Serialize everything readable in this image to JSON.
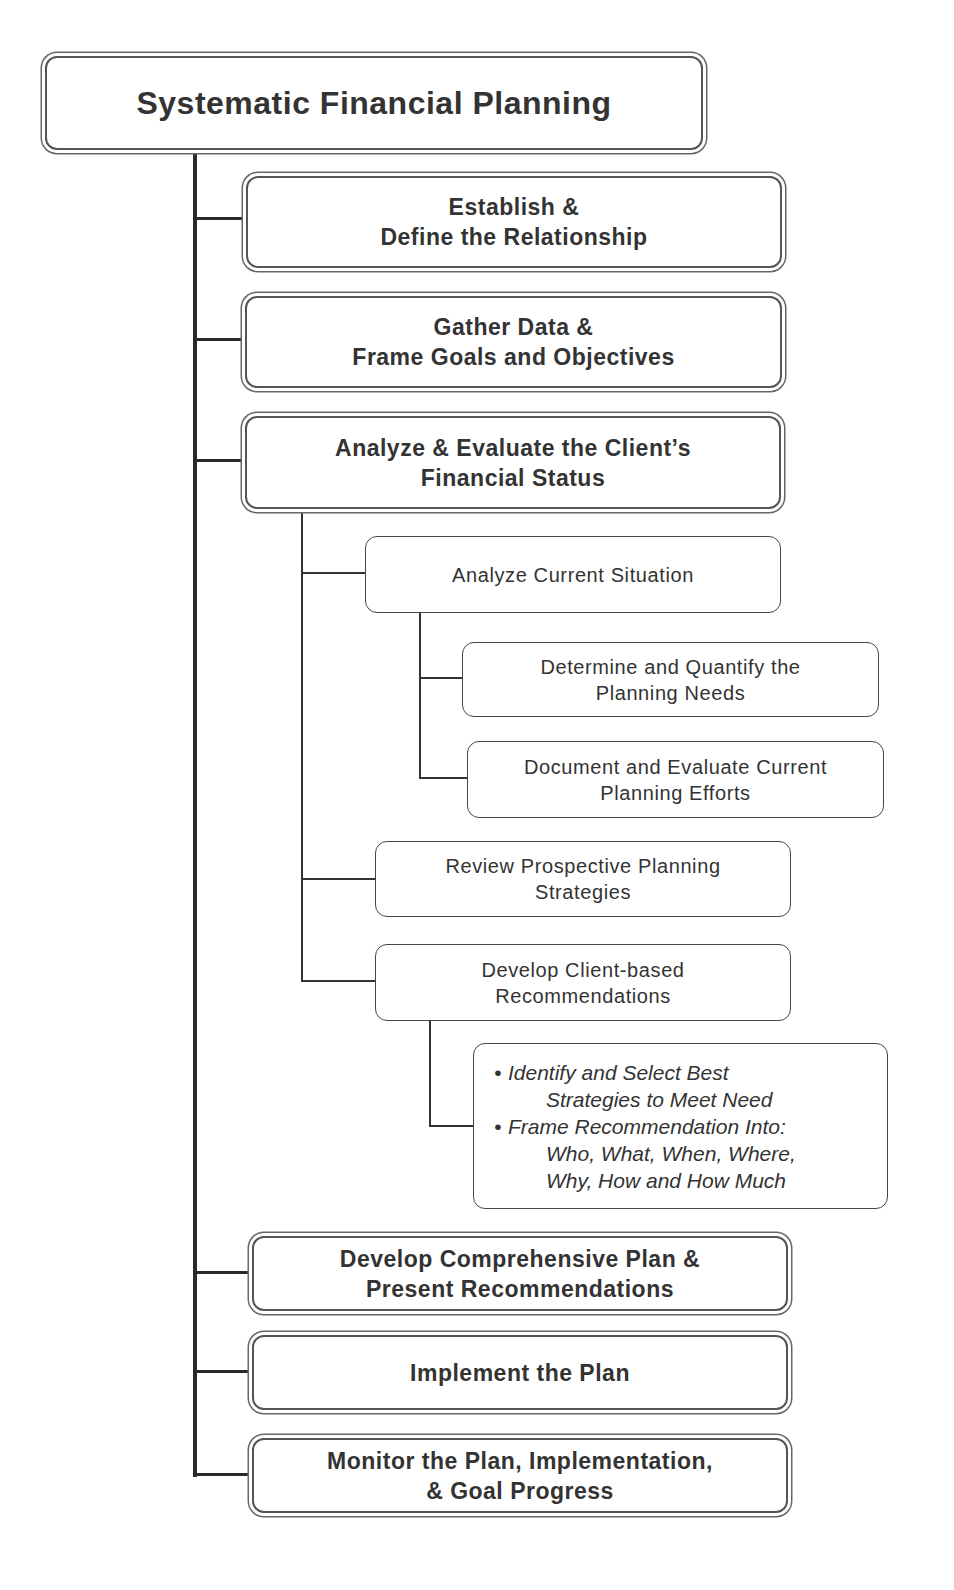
{
  "diagram": {
    "title": "Systematic Financial Planning",
    "steps": [
      {
        "line1": "Establish &",
        "line2": "Define the Relationship"
      },
      {
        "line1": "Gather Data &",
        "line2": "Frame Goals and Objectives"
      },
      {
        "line1": "Analyze & Evaluate the Client’s",
        "line2": "Financial Status"
      },
      {
        "line1": "Develop Comprehensive Plan &",
        "line2": "Present Recommendations"
      },
      {
        "line1": "Implement the Plan"
      },
      {
        "line1": "Monitor the Plan, Implementation,",
        "line2": "& Goal Progress"
      }
    ],
    "analyze_substeps": [
      {
        "line1": "Analyze Current Situation"
      },
      {
        "line1": "Review Prospective Planning",
        "line2": "Strategies"
      },
      {
        "line1": "Develop Client-based",
        "line2": "Recommendations"
      }
    ],
    "current_situation_substeps": [
      {
        "line1": "Determine and Quantify the",
        "line2": "Planning Needs"
      },
      {
        "line1": "Document and Evaluate Current",
        "line2": "Planning Efforts"
      }
    ],
    "recommendation_details": {
      "bullet": "•",
      "items": [
        {
          "line1": "Identify and Select Best",
          "line2": "Strategies to Meet Need"
        },
        {
          "line1": "Frame Recommendation Into:",
          "line2": "Who, What, When, Where,",
          "line3": "Why, How and How Much"
        }
      ]
    }
  }
}
